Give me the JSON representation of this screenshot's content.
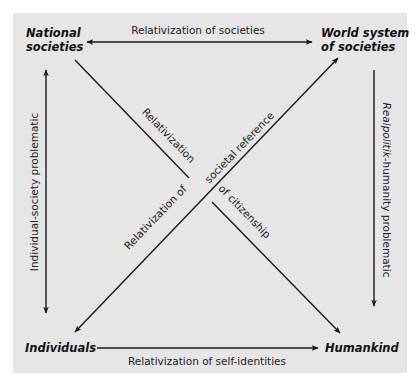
{
  "diagram": {
    "colors": {
      "panel_background": "#e6e6e6",
      "line": "#1a1a1a",
      "text": "#222222"
    },
    "nodes": {
      "top_left": {
        "line1": "National",
        "line2": "societies"
      },
      "top_right": {
        "line1": "World system",
        "line2": "of societies"
      },
      "bottom_left": {
        "label": "Individuals"
      },
      "bottom_right": {
        "label": "Humankind"
      }
    },
    "edges": {
      "top": {
        "label": "Relativization of societies",
        "direction": "bidirectional"
      },
      "bottom": {
        "label": "Relativization of self-identities",
        "direction": "left-to-right"
      },
      "left": {
        "label": "Individual-society problematic",
        "direction": "bidirectional"
      },
      "right": {
        "label_italic": "Realpolitik",
        "label_rest": "-humanity problematic",
        "direction": "top-to-bottom"
      },
      "diagonal_sw_ne": {
        "part1": "Relativization of",
        "part2": "societal reference",
        "direction": "bidirectional"
      },
      "diagonal_nw_se": {
        "part1": "Relativization",
        "part2": "of citizenship",
        "direction": "nw-to-se"
      }
    }
  }
}
